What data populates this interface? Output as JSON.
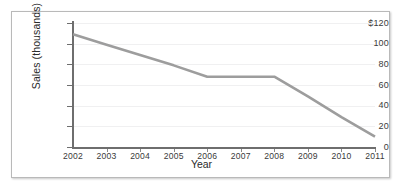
{
  "chart_data": {
    "type": "line",
    "title": "",
    "xlabel": "Year",
    "ylabel": "Sales (thousands)",
    "x": [
      2002,
      2003,
      2004,
      2005,
      2006,
      2007,
      2008,
      2009,
      2010,
      2011
    ],
    "categories": [
      "2002",
      "2003",
      "2004",
      "2005",
      "2006",
      "2007",
      "2008",
      "2009",
      "2010",
      "2011"
    ],
    "values": [
      109,
      99,
      89,
      79,
      68,
      68,
      68,
      49,
      29,
      10
    ],
    "series": [
      {
        "name": "Sales",
        "values": [
          109,
          99,
          89,
          79,
          68,
          68,
          68,
          49,
          29,
          10
        ],
        "color": "#9d9d9d"
      }
    ],
    "xlim": [
      2002,
      2011
    ],
    "ylim": [
      0,
      120
    ],
    "ytick_values": [
      0,
      20,
      40,
      60,
      80,
      100,
      120
    ],
    "ytick_labels": [
      "0",
      "20",
      "40",
      "60",
      "80",
      "100",
      "$120"
    ],
    "xtick_labels": [
      "2002",
      "2003",
      "2004",
      "2005",
      "2006",
      "2007",
      "2008",
      "2009",
      "2010",
      "2011"
    ],
    "grid": true,
    "grid_axis": "y",
    "legend": false,
    "legend_position": "none",
    "annotations": []
  },
  "figure": {
    "border_color": "#b9b9b9",
    "background_color": "#ffffff",
    "axis_color": "#6e6e6e",
    "gridline_color": "#f0f0f1",
    "line_color": "#9d9d9d",
    "tick_label_color": "#3a3a3a"
  }
}
